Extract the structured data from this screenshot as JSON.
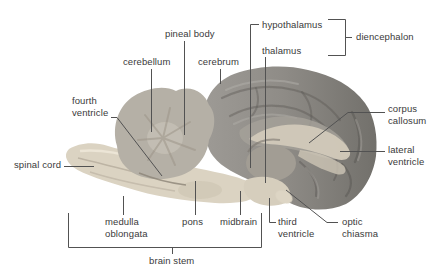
{
  "caption_partial": "b. Lateral view",
  "labels": {
    "pineal_body": "pineal body",
    "cerebellum": "cerebellum",
    "cerebrum": "cerebrum",
    "hypothalamus": "hypothalamus",
    "thalamus": "thalamus",
    "diencephalon": "diencephalon",
    "fourth_ventricle": {
      "l1": "fourth",
      "l2": "ventricle"
    },
    "corpus_callosum": {
      "l1": "corpus",
      "l2": "callosum"
    },
    "lateral_ventricle": {
      "l1": "lateral",
      "l2": "ventricle"
    },
    "spinal_cord": "spinal cord",
    "medulla_oblongata": {
      "l1": "medulla",
      "l2": "oblongata"
    },
    "pons": "pons",
    "midbrain": "midbrain",
    "third_ventricle": {
      "l1": "third",
      "l2": "ventricle"
    },
    "optic_chiasma": {
      "l1": "optic",
      "l2": "chiasma"
    },
    "brain_stem": "brain stem"
  },
  "colors": {
    "background": "#ffffff",
    "label_text": "#3a3a3a",
    "leader_line": "#525252",
    "cerebrum_light": "#989590",
    "cerebrum_dark": "#72706b",
    "cerebellum": "#b5b0a6",
    "brainstem": "#dbd3c2",
    "corpus_callosum_band": "#d2caba",
    "thalamus_oval": "#a29d94"
  }
}
